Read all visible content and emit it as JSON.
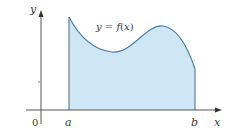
{
  "figure": {
    "curve_label": "y = f(x)",
    "curve_label_parts": {
      "y": "y",
      "eq": " = ",
      "f": "f",
      "open": "(",
      "x": "x",
      "close": ")"
    },
    "axes": {
      "x_label": "x",
      "y_label": "y",
      "origin_label": "0"
    },
    "bounds": {
      "lower": "a",
      "upper": "b"
    },
    "colors": {
      "fill": "#cfe6f5",
      "curve": "#4a7fa8",
      "axis": "#555555",
      "text": "#3a3a3a"
    }
  }
}
